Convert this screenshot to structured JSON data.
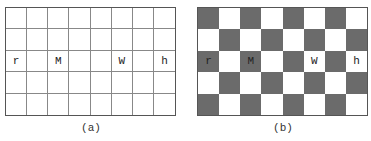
{
  "figures": [
    {
      "id": "a",
      "caption": "(a)",
      "style": "plain-grid",
      "rows": 5,
      "cols": 8,
      "letters": [
        {
          "row": 2,
          "col": 0,
          "char": "r"
        },
        {
          "row": 2,
          "col": 2,
          "char": "M"
        },
        {
          "row": 2,
          "col": 5,
          "char": "W"
        },
        {
          "row": 2,
          "col": 7,
          "char": "h"
        }
      ]
    },
    {
      "id": "b",
      "caption": "(b)",
      "style": "checkerboard",
      "rows": 5,
      "cols": 8,
      "dark_color": "#6b6b6b",
      "light_color": "#ffffff",
      "letters": [
        {
          "row": 2,
          "col": 0,
          "char": "r"
        },
        {
          "row": 2,
          "col": 2,
          "char": "M"
        },
        {
          "row": 2,
          "col": 5,
          "char": "W"
        },
        {
          "row": 2,
          "col": 7,
          "char": "h"
        }
      ]
    }
  ]
}
